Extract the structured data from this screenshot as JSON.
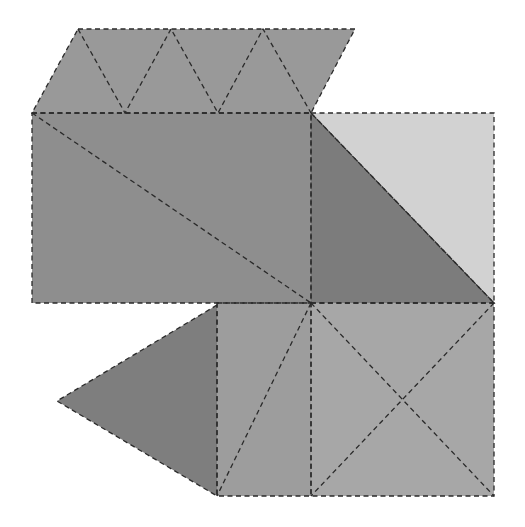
{
  "diagram": {
    "type": "polyhedron-net",
    "canvas": {
      "width": 525,
      "height": 527,
      "background": "#ffffff"
    },
    "fold_line_style": "dashed",
    "faces": [
      {
        "id": "top-parallelogram",
        "points": [
          [
            78,
            29
          ],
          [
            355,
            29
          ],
          [
            311,
            113
          ],
          [
            32,
            113
          ]
        ],
        "color": "#999999"
      },
      {
        "id": "main-rectangle",
        "points": [
          [
            32,
            113
          ],
          [
            311,
            113
          ],
          [
            311,
            303
          ],
          [
            32,
            303
          ]
        ],
        "color": "#8e8e8e"
      },
      {
        "id": "right-light-triangle",
        "points": [
          [
            311,
            113
          ],
          [
            494,
            113
          ],
          [
            494,
            303
          ]
        ],
        "color": "#d2d2d2"
      },
      {
        "id": "right-dark-triangle",
        "points": [
          [
            311,
            113
          ],
          [
            494,
            303
          ],
          [
            311,
            303
          ]
        ],
        "color": "#7c7c7c"
      },
      {
        "id": "left-triangle",
        "points": [
          [
            217,
            305
          ],
          [
            57,
            401
          ],
          [
            217,
            496
          ]
        ],
        "color": "#7e7e7e"
      },
      {
        "id": "middle-rectangle",
        "points": [
          [
            217,
            303
          ],
          [
            311,
            303
          ],
          [
            311,
            496
          ],
          [
            217,
            496
          ]
        ],
        "color": "#9d9d9d"
      },
      {
        "id": "bottom-square",
        "points": [
          [
            311,
            303
          ],
          [
            494,
            303
          ],
          [
            494,
            496
          ],
          [
            311,
            496
          ]
        ],
        "color": "#a7a7a7"
      }
    ],
    "fold_lines": [
      {
        "id": "top-zigzag",
        "points": [
          [
            78,
            29
          ],
          [
            125,
            113
          ],
          [
            171,
            29
          ],
          [
            218,
            113
          ],
          [
            263,
            29
          ],
          [
            311,
            113
          ]
        ]
      },
      {
        "id": "main-diagonal",
        "points": [
          [
            32,
            113
          ],
          [
            311,
            303
          ]
        ]
      },
      {
        "id": "middle-diagonal",
        "points": [
          [
            311,
            303
          ],
          [
            217,
            496
          ]
        ]
      },
      {
        "id": "square-diagonal-1",
        "points": [
          [
            311,
            303
          ],
          [
            494,
            496
          ]
        ]
      },
      {
        "id": "square-diagonal-2",
        "points": [
          [
            494,
            303
          ],
          [
            311,
            496
          ]
        ]
      }
    ]
  }
}
